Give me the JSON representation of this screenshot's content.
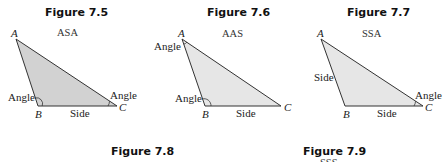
{
  "figures": [
    {
      "title": "Figure 7.5",
      "caption": "ASA",
      "vertices": {
        "A": "A",
        "B": "B",
        "C": "C"
      },
      "labels": {
        "angle_b": "Angle",
        "angle_c": "Angle",
        "side_bc": "Side"
      }
    },
    {
      "title": "Figure 7.6",
      "caption": "AAS",
      "vertices": {
        "A": "A",
        "B": "B",
        "C": "C"
      },
      "labels": {
        "angle_a": "Angle",
        "angle_b": "Angle",
        "side_bc": "Side"
      }
    },
    {
      "title": "Figure 7.7",
      "caption": "SSA",
      "vertices": {
        "A": "A",
        "B": "B",
        "C": "C"
      },
      "labels": {
        "side_ab": "Side",
        "angle_c": "Angle",
        "side_bc": "Side"
      }
    }
  ],
  "bottom_titles": [
    {
      "title": "Figure 7.8"
    },
    {
      "title": "Figure 7.9",
      "caption_partial": "SSS"
    }
  ],
  "colors": {
    "fill_dark": "#d2d2d2",
    "fill_light": "#e6e6e6",
    "stroke": "#333333"
  }
}
